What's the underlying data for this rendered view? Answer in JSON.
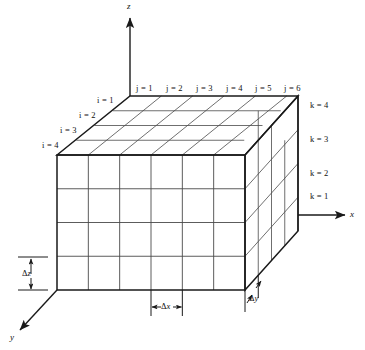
{
  "figure": {
    "background_color": "#ffffff",
    "line_color": "#1a1a1a",
    "grid_line_color": "#4a4a4a"
  },
  "axes": [
    {
      "name": "z-axis",
      "label": "z"
    },
    {
      "name": "x-axis",
      "label": "x"
    },
    {
      "name": "y-axis",
      "label": "y"
    }
  ],
  "axis_labels": {
    "z": "z",
    "x": "x",
    "y": "y"
  },
  "column_labels": {
    "name": "j-index-labels",
    "items": [
      {
        "label": "j = 1"
      },
      {
        "label": "j = 2"
      },
      {
        "label": "j = 3"
      },
      {
        "label": "j = 4"
      },
      {
        "label": "j = 5"
      },
      {
        "label": "j = 6"
      }
    ]
  },
  "depth_labels": {
    "name": "i-index-labels",
    "items": [
      {
        "label": "i = 1"
      },
      {
        "label": "i = 2"
      },
      {
        "label": "i = 3"
      },
      {
        "label": "i = 4"
      }
    ]
  },
  "layer_labels": {
    "name": "k-index-labels",
    "items": [
      {
        "label": "k  = 4"
      },
      {
        "label": "k  = 3"
      },
      {
        "label": "k  = 2"
      },
      {
        "label": "k  = 1"
      }
    ]
  },
  "dimension_markers": [
    {
      "name": "delta-z",
      "symbol": "Δ",
      "variable": "z"
    },
    {
      "name": "delta-x",
      "symbol": "Δ",
      "variable": "x"
    },
    {
      "name": "delta-y",
      "symbol": "Δ",
      "variable": "y"
    }
  ],
  "grid": {
    "columns_j": 6,
    "rows_k": 4,
    "depth_i": 4
  }
}
